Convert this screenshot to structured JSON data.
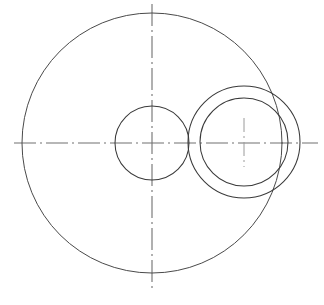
{
  "drawing": {
    "title": "Mechanical Part Outline",
    "view_label": "Front View",
    "background_color": "#ffffff",
    "line_color": "#3a3a3a",
    "centerline_color": "#808080",
    "canvas": {
      "width": 324,
      "height": 305
    },
    "units": "px",
    "line_styles": {
      "visible_edge": "continuous-thin",
      "axis": "dash-dot"
    },
    "features": [
      {
        "id": "main-body",
        "name": "main-body-circle",
        "type": "circle",
        "cx": 152,
        "cy": 143,
        "r": 130,
        "style": "visible-edge"
      },
      {
        "id": "center-bore",
        "name": "center-bore-circle",
        "type": "circle",
        "cx": 152,
        "cy": 143,
        "r": 37,
        "style": "visible-edge"
      },
      {
        "id": "boss-outer",
        "name": "side-boss-outer-circle",
        "type": "circle",
        "cx": 244,
        "cy": 142,
        "r": 56,
        "style": "visible-edge"
      },
      {
        "id": "boss-inner",
        "name": "side-boss-inner-circle",
        "type": "circle",
        "cx": 244,
        "cy": 142,
        "r": 44,
        "style": "visible-edge"
      }
    ],
    "axes": [
      {
        "id": "horizontal-axis",
        "name": "horizontal-centerline",
        "orientation": "horizontal",
        "x1": 14,
        "y1": 143,
        "x2": 318,
        "y2": 143,
        "style": "dash-dot"
      },
      {
        "id": "vertical-axis",
        "name": "vertical-centerline",
        "orientation": "vertical",
        "x1": 152,
        "y1": 4,
        "x2": 152,
        "y2": 291,
        "style": "dash-dot"
      },
      {
        "id": "boss-center-mark",
        "name": "side-boss-center-mark",
        "orientation": "vertical",
        "x1": 244,
        "y1": 118,
        "x2": 244,
        "y2": 167,
        "style": "dash-dot"
      }
    ]
  }
}
